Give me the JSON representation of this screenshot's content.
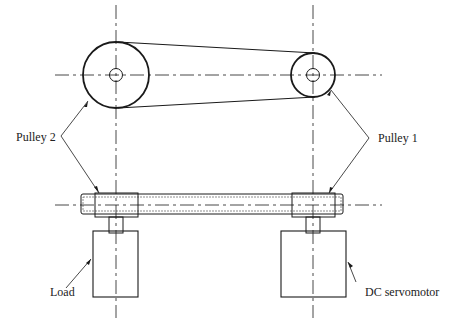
{
  "diagram": {
    "type": "belt-drive mechanism (top and front view)",
    "labels": {
      "pulley2": "Pulley 2",
      "pulley1": "Pulley 1",
      "load": "Load",
      "motor": "DC servomotor"
    },
    "colors": {
      "line": "#1a1a1a",
      "background": "#ffffff"
    }
  }
}
